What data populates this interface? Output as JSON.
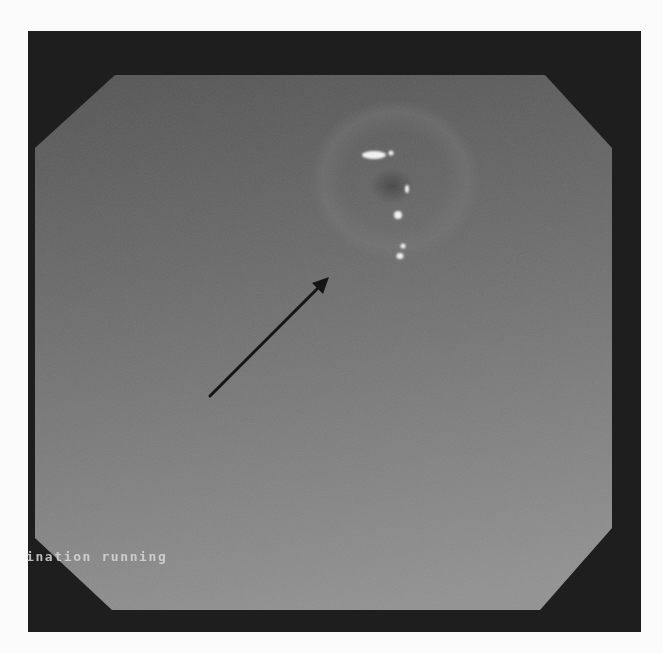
{
  "image": {
    "description": "Endoscopic view (grayscale) within octagonal mask on black frame, with an annotation arrow pointing to mucosa near specular highlights",
    "overlay_text": "ination running",
    "colors": {
      "page_background": "#fbfbfb",
      "frame": "#1e1e1e",
      "mucosa_dark": "#4a4a4a",
      "mucosa_light": "#8c8c8c",
      "arrow": "#151515",
      "highlight": "#f2f2f2"
    },
    "arrow": {
      "from": [
        210,
        396
      ],
      "to": [
        328,
        278
      ]
    },
    "highlights": [
      {
        "cx": 374,
        "cy": 155,
        "rx": 12,
        "ry": 4
      },
      {
        "cx": 391,
        "cy": 153,
        "rx": 2.5,
        "ry": 2.5
      },
      {
        "cx": 407,
        "cy": 189,
        "rx": 2,
        "ry": 4
      },
      {
        "cx": 398,
        "cy": 215,
        "rx": 4,
        "ry": 4
      },
      {
        "cx": 403,
        "cy": 246,
        "rx": 2.5,
        "ry": 2.5
      },
      {
        "cx": 400,
        "cy": 256,
        "rx": 3.5,
        "ry": 3
      }
    ]
  }
}
